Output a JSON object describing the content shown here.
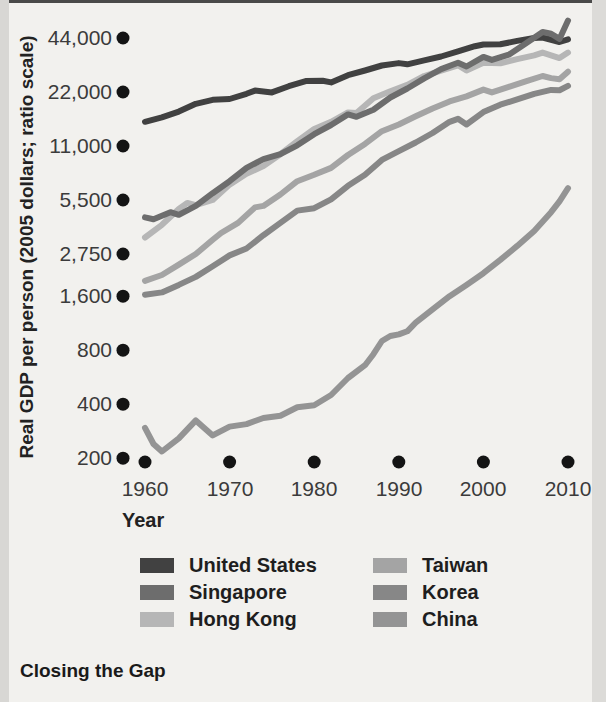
{
  "page": {
    "caption": "Closing the Gap"
  },
  "chart_data": {
    "type": "line",
    "title": "Closing the Gap",
    "xlabel": "Year",
    "ylabel": "Real GDP per person (2005 dollars; ratio scale)",
    "y_scale": "log-ratio",
    "grid": false,
    "legend_position": "below, two columns",
    "x_range": [
      1960,
      2010
    ],
    "x_ticks": [
      1960,
      1970,
      1980,
      1990,
      2000,
      2010
    ],
    "y_ticks": [
      {
        "value": 44000,
        "label": "44,000"
      },
      {
        "value": 22000,
        "label": "22,000"
      },
      {
        "value": 11000,
        "label": "11,000"
      },
      {
        "value": 5500,
        "label": "5,500"
      },
      {
        "value": 2750,
        "label": "2,750"
      },
      {
        "value": 1600,
        "label": "1,600"
      },
      {
        "value": 800,
        "label": "800"
      },
      {
        "value": 400,
        "label": "400"
      },
      {
        "value": 200,
        "label": "200"
      }
    ],
    "series": [
      {
        "name": "United States",
        "color": "#414141",
        "points": [
          [
            1960,
            15000
          ],
          [
            1962,
            15900
          ],
          [
            1964,
            17100
          ],
          [
            1966,
            18900
          ],
          [
            1968,
            19900
          ],
          [
            1970,
            20100
          ],
          [
            1972,
            21500
          ],
          [
            1973,
            22400
          ],
          [
            1975,
            21900
          ],
          [
            1977,
            23700
          ],
          [
            1979,
            25300
          ],
          [
            1981,
            25400
          ],
          [
            1982,
            24900
          ],
          [
            1984,
            27300
          ],
          [
            1986,
            29000
          ],
          [
            1988,
            30900
          ],
          [
            1990,
            31900
          ],
          [
            1991,
            31400
          ],
          [
            1993,
            33000
          ],
          [
            1995,
            34700
          ],
          [
            1997,
            37100
          ],
          [
            1999,
            39600
          ],
          [
            2000,
            40500
          ],
          [
            2002,
            40600
          ],
          [
            2004,
            42400
          ],
          [
            2006,
            44000
          ],
          [
            2007,
            44300
          ],
          [
            2009,
            41800
          ],
          [
            2010,
            43200
          ]
        ]
      },
      {
        "name": "Singapore",
        "color": "#6d6d6d",
        "points": [
          [
            1960,
            4400
          ],
          [
            1961,
            4300
          ],
          [
            1963,
            4700
          ],
          [
            1964,
            4550
          ],
          [
            1966,
            5100
          ],
          [
            1968,
            6000
          ],
          [
            1970,
            7000
          ],
          [
            1972,
            8300
          ],
          [
            1974,
            9300
          ],
          [
            1976,
            9900
          ],
          [
            1978,
            11100
          ],
          [
            1980,
            12800
          ],
          [
            1982,
            14400
          ],
          [
            1984,
            16500
          ],
          [
            1985,
            16000
          ],
          [
            1987,
            17500
          ],
          [
            1989,
            20500
          ],
          [
            1991,
            23000
          ],
          [
            1993,
            26200
          ],
          [
            1995,
            29500
          ],
          [
            1997,
            32000
          ],
          [
            1998,
            30500
          ],
          [
            2000,
            34500
          ],
          [
            2001,
            33200
          ],
          [
            2003,
            35500
          ],
          [
            2005,
            41000
          ],
          [
            2007,
            47500
          ],
          [
            2008,
            46500
          ],
          [
            2009,
            43500
          ],
          [
            2010,
            55000
          ]
        ]
      },
      {
        "name": "Hong Kong",
        "color": "#b6b6b6",
        "points": [
          [
            1960,
            3400
          ],
          [
            1962,
            4000
          ],
          [
            1964,
            4900
          ],
          [
            1965,
            5300
          ],
          [
            1966,
            5150
          ],
          [
            1968,
            5500
          ],
          [
            1970,
            6700
          ],
          [
            1972,
            7700
          ],
          [
            1974,
            8500
          ],
          [
            1976,
            9900
          ],
          [
            1978,
            11700
          ],
          [
            1980,
            13700
          ],
          [
            1982,
            15000
          ],
          [
            1984,
            16900
          ],
          [
            1985,
            16800
          ],
          [
            1987,
            20300
          ],
          [
            1989,
            22200
          ],
          [
            1991,
            24100
          ],
          [
            1993,
            27000
          ],
          [
            1995,
            28900
          ],
          [
            1997,
            31000
          ],
          [
            1998,
            29000
          ],
          [
            2000,
            32000
          ],
          [
            2002,
            31800
          ],
          [
            2004,
            33500
          ],
          [
            2006,
            35200
          ],
          [
            2007,
            36500
          ],
          [
            2009,
            34000
          ],
          [
            2010,
            36500
          ]
        ]
      },
      {
        "name": "Taiwan",
        "color": "#a4a4a4",
        "points": [
          [
            1960,
            1950
          ],
          [
            1962,
            2100
          ],
          [
            1964,
            2400
          ],
          [
            1966,
            2750
          ],
          [
            1968,
            3300
          ],
          [
            1969,
            3600
          ],
          [
            1971,
            4100
          ],
          [
            1973,
            5000
          ],
          [
            1974,
            5100
          ],
          [
            1976,
            5900
          ],
          [
            1978,
            7000
          ],
          [
            1980,
            7600
          ],
          [
            1982,
            8300
          ],
          [
            1984,
            9800
          ],
          [
            1986,
            11300
          ],
          [
            1988,
            13300
          ],
          [
            1990,
            14500
          ],
          [
            1992,
            16100
          ],
          [
            1994,
            17800
          ],
          [
            1996,
            19500
          ],
          [
            1998,
            20800
          ],
          [
            2000,
            22700
          ],
          [
            2001,
            21900
          ],
          [
            2003,
            23500
          ],
          [
            2005,
            25200
          ],
          [
            2007,
            27000
          ],
          [
            2008,
            26300
          ],
          [
            2009,
            25900
          ],
          [
            2010,
            28500
          ]
        ]
      },
      {
        "name": "Korea",
        "color": "#878787",
        "points": [
          [
            1960,
            1630
          ],
          [
            1962,
            1680
          ],
          [
            1964,
            1850
          ],
          [
            1966,
            2050
          ],
          [
            1968,
            2350
          ],
          [
            1970,
            2700
          ],
          [
            1972,
            2950
          ],
          [
            1974,
            3500
          ],
          [
            1976,
            4100
          ],
          [
            1978,
            4800
          ],
          [
            1980,
            4950
          ],
          [
            1982,
            5550
          ],
          [
            1984,
            6600
          ],
          [
            1986,
            7600
          ],
          [
            1988,
            9200
          ],
          [
            1990,
            10300
          ],
          [
            1992,
            11500
          ],
          [
            1994,
            13000
          ],
          [
            1996,
            15000
          ],
          [
            1997,
            15600
          ],
          [
            1998,
            14500
          ],
          [
            2000,
            17000
          ],
          [
            2002,
            18700
          ],
          [
            2004,
            20000
          ],
          [
            2006,
            21500
          ],
          [
            2008,
            22600
          ],
          [
            2009,
            22500
          ],
          [
            2010,
            23800
          ]
        ]
      },
      {
        "name": "China",
        "color": "#949494",
        "points": [
          [
            1960,
            295
          ],
          [
            1961,
            240
          ],
          [
            1962,
            218
          ],
          [
            1964,
            258
          ],
          [
            1966,
            325
          ],
          [
            1968,
            268
          ],
          [
            1970,
            300
          ],
          [
            1972,
            310
          ],
          [
            1974,
            335
          ],
          [
            1976,
            345
          ],
          [
            1978,
            385
          ],
          [
            1980,
            395
          ],
          [
            1982,
            450
          ],
          [
            1984,
            560
          ],
          [
            1986,
            660
          ],
          [
            1987,
            760
          ],
          [
            1988,
            900
          ],
          [
            1989,
            960
          ],
          [
            1990,
            980
          ],
          [
            1991,
            1020
          ],
          [
            1992,
            1140
          ],
          [
            1994,
            1350
          ],
          [
            1996,
            1600
          ],
          [
            1998,
            1850
          ],
          [
            2000,
            2150
          ],
          [
            2002,
            2550
          ],
          [
            2004,
            3050
          ],
          [
            2006,
            3700
          ],
          [
            2008,
            4700
          ],
          [
            2009,
            5400
          ],
          [
            2010,
            6400
          ]
        ]
      }
    ]
  }
}
